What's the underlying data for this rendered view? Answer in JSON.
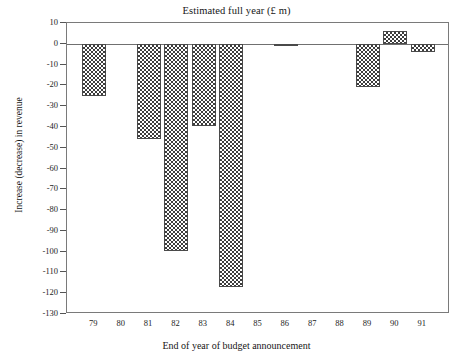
{
  "chart_data": {
    "type": "bar",
    "title": "Estimated full year (£ m)",
    "xlabel": "End of year of budget announcement",
    "ylabel": "Increase (decrease) in revenue",
    "categories": [
      "79",
      "80",
      "81",
      "82",
      "83",
      "84",
      "85",
      "86",
      "87",
      "88",
      "89",
      "90",
      "91"
    ],
    "values": [
      -25,
      0,
      -46,
      -99.5,
      -39.5,
      -117,
      0,
      -1,
      0,
      0,
      -21,
      6,
      -4
    ],
    "ylim": [
      -130,
      10
    ],
    "ytick_values": [
      10,
      0,
      -10,
      -20,
      -30,
      -40,
      -50,
      -60,
      -70,
      -80,
      -90,
      -100,
      -110,
      -120,
      -130
    ],
    "ytick_labels": [
      "10",
      "0",
      "-10",
      "-20",
      "-30",
      "-40",
      "-50",
      "-60",
      "-70",
      "-80",
      "-90",
      "-100",
      "-110",
      "-120",
      "-130"
    ],
    "grid": false,
    "legend": false,
    "bar_fill": "checkerboard-hatch",
    "bar_color": "#3d3d3d",
    "axis_color": "#707070"
  }
}
